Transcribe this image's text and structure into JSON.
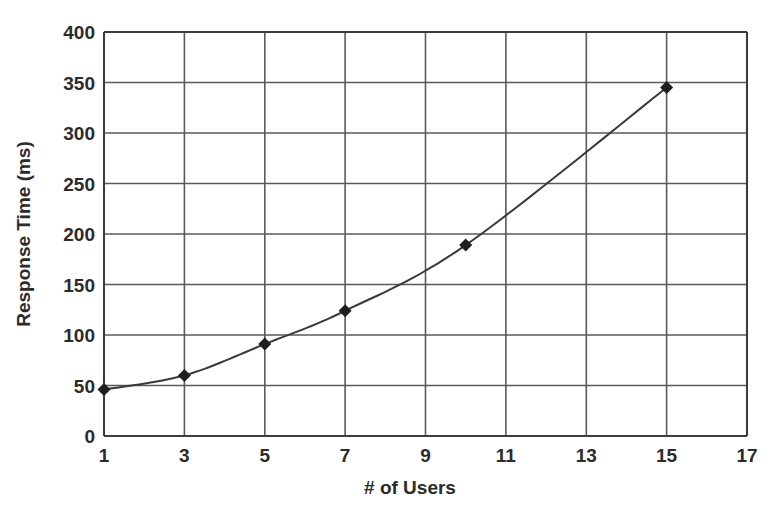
{
  "chart_data": {
    "type": "line",
    "title": "",
    "xlabel": "# of Users",
    "ylabel": "Response Time (ms)",
    "xlim": [
      1,
      17
    ],
    "ylim": [
      0,
      400
    ],
    "grid": true,
    "legend": false,
    "x_ticks": [
      "1",
      "3",
      "5",
      "7",
      "9",
      "11",
      "13",
      "15",
      "17"
    ],
    "y_ticks": [
      "0",
      "50",
      "100",
      "150",
      "200",
      "250",
      "300",
      "350",
      "400"
    ],
    "x_tick_values": [
      1,
      3,
      5,
      7,
      9,
      11,
      13,
      15,
      17
    ],
    "y_tick_values": [
      0,
      50,
      100,
      150,
      200,
      250,
      300,
      350,
      400
    ],
    "marker": "diamond",
    "series": [
      {
        "name": "Response Time",
        "x": [
          1,
          3,
          5,
          7,
          10,
          15
        ],
        "values": [
          46,
          60,
          91,
          124,
          189,
          345
        ]
      }
    ]
  },
  "axes": {
    "y_title": "Response Time (ms)",
    "x_title": "# of Users"
  },
  "caption": {
    "text": ""
  },
  "colors": {
    "line": "#3a3a3a",
    "marker": "#1f1f1f",
    "grid": "#5a5a5a",
    "frame": "#3d3d3d",
    "text": "#2b2b2b",
    "background": "#ffffff"
  }
}
